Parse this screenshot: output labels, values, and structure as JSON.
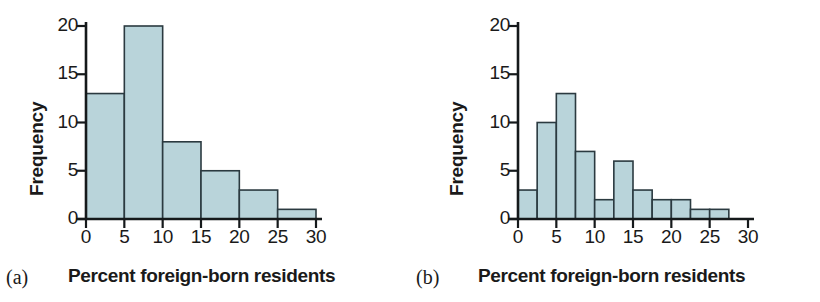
{
  "figure": {
    "panels": [
      {
        "letter": "(a)",
        "xlabel": "Percent foreign-born residents",
        "ylabel": "Frequency"
      },
      {
        "letter": "(b)",
        "xlabel": "Percent foreign-born residents",
        "ylabel": "Frequency"
      }
    ],
    "colors": {
      "bar_fill": "#b9d4da",
      "bar_stroke": "#2b3a40",
      "axis": "#15191b",
      "text": "#1a1a1a",
      "background": "#ffffff"
    }
  },
  "chart_data": [
    {
      "type": "bar",
      "title": "",
      "panel": "(a)",
      "xlabel": "Percent foreign-born residents",
      "ylabel": "Frequency",
      "xlim": [
        0,
        30
      ],
      "ylim": [
        0,
        21
      ],
      "xticks": [
        0,
        5,
        10,
        15,
        20,
        25,
        30
      ],
      "xtick_labels": [
        "0",
        "5",
        "10",
        "15",
        "20",
        "25",
        "30"
      ],
      "yticks": [
        0,
        5,
        10,
        15,
        20
      ],
      "ytick_labels": [
        "0",
        "5",
        "10",
        "15",
        "20"
      ],
      "grid": false,
      "legend": "none",
      "bin_width": 5,
      "bin_edges": [
        0,
        5,
        10,
        15,
        20,
        25,
        30
      ],
      "categories": [
        "0-5",
        "5-10",
        "10-15",
        "15-20",
        "20-25",
        "25-30"
      ],
      "values": [
        13,
        20,
        8,
        5,
        3,
        1
      ]
    },
    {
      "type": "bar",
      "title": "",
      "panel": "(b)",
      "xlabel": "Percent foreign-born residents",
      "ylabel": "Frequency",
      "xlim": [
        0,
        30
      ],
      "ylim": [
        0,
        21
      ],
      "xticks": [
        0,
        5,
        10,
        15,
        20,
        25,
        30
      ],
      "xtick_labels": [
        "0",
        "5",
        "10",
        "15",
        "20",
        "25",
        "30"
      ],
      "yticks": [
        0,
        5,
        10,
        15,
        20
      ],
      "ytick_labels": [
        "0",
        "5",
        "10",
        "15",
        "20"
      ],
      "grid": false,
      "legend": "none",
      "bin_width": 2.5,
      "bin_edges": [
        0,
        2.5,
        5,
        7.5,
        10,
        12.5,
        15,
        17.5,
        20,
        22.5,
        25,
        27.5
      ],
      "categories": [
        "0-2.5",
        "2.5-5",
        "5-7.5",
        "7.5-10",
        "10-12.5",
        "12.5-15",
        "15-17.5",
        "17.5-20",
        "20-22.5",
        "22.5-25",
        "25-27.5"
      ],
      "values": [
        3,
        10,
        13,
        7,
        2,
        6,
        3,
        2,
        2,
        1,
        1
      ]
    }
  ]
}
